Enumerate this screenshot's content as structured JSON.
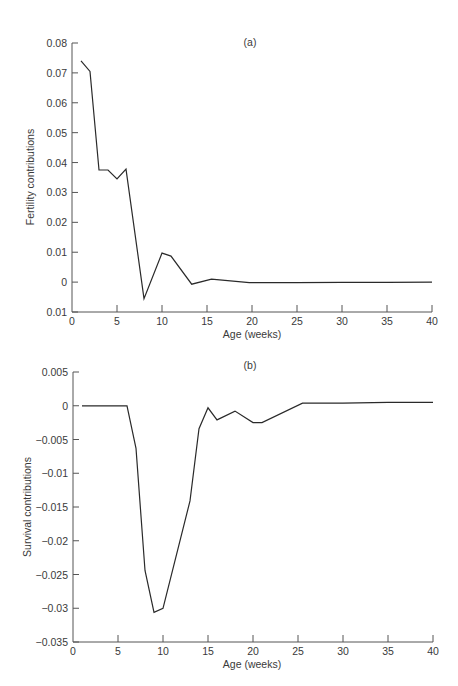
{
  "chart_data": [
    {
      "type": "line",
      "panel_label": "(a)",
      "title": "",
      "xlabel": "Age (weeks)",
      "ylabel": "Fertility contributions",
      "xlim": [
        0,
        40
      ],
      "ylim": [
        -0.01,
        0.08
      ],
      "xticks": [
        0,
        5,
        10,
        15,
        20,
        25,
        30,
        35,
        40
      ],
      "xtick_labels": [
        "0",
        "5",
        "10",
        "15",
        "20",
        "25",
        "30",
        "35",
        "40"
      ],
      "yticks": [
        0.08,
        0.07,
        0.06,
        0.05,
        0.04,
        0.03,
        0.02,
        0.01,
        0,
        -0.01
      ],
      "ytick_labels": [
        "0.08",
        "0.07",
        "0.06",
        "0.05",
        "0.04",
        "0.03",
        "0.02",
        "0.01",
        "0",
        "0.01"
      ],
      "grid": false,
      "legend": null,
      "series": [
        {
          "name": "Fertility contributions",
          "x": [
            1,
            2,
            3,
            4,
            5,
            6,
            8,
            10,
            11,
            13.3,
            15.5,
            19.7,
            25,
            30,
            35,
            40
          ],
          "y": [
            0.074,
            0.0705,
            0.0375,
            0.0375,
            0.0345,
            0.0378,
            -0.0055,
            0.0097,
            0.0087,
            -0.0007,
            0.001,
            -0.0002,
            -0.0002,
            -0.0001,
            -0.0001,
            0.0
          ]
        }
      ]
    },
    {
      "type": "line",
      "panel_label": "(b)",
      "title": "",
      "xlabel": "Age (weeks)",
      "ylabel": "Survival contributions",
      "xlim": [
        0,
        40
      ],
      "ylim": [
        -0.035,
        0.005
      ],
      "xticks": [
        0,
        5,
        10,
        15,
        20,
        25,
        30,
        35,
        40
      ],
      "xtick_labels": [
        "0",
        "5",
        "10",
        "15",
        "20",
        "25",
        "30",
        "35",
        "40"
      ],
      "yticks": [
        0.005,
        0,
        -0.005,
        -0.01,
        -0.015,
        -0.02,
        -0.025,
        -0.03,
        -0.035
      ],
      "ytick_labels": [
        "0.005",
        "0",
        "−0.005",
        "−0.01",
        "−0.015",
        "−0.02",
        "−0.025",
        "−0.03",
        "−0.035"
      ],
      "grid": false,
      "legend": null,
      "series": [
        {
          "name": "Survival contributions",
          "x": [
            1,
            2,
            3,
            4,
            5,
            6,
            7,
            8,
            9,
            10,
            13,
            14,
            15,
            16,
            18,
            20,
            21,
            25.5,
            30,
            35,
            40
          ],
          "y": [
            0,
            0,
            0,
            0,
            0,
            0,
            -0.0063,
            -0.0244,
            -0.0306,
            -0.03,
            -0.0141,
            -0.0034,
            -0.0003,
            -0.0021,
            -0.0008,
            -0.0025,
            -0.0025,
            0.0004,
            0.0004,
            0.0005,
            0.0005
          ]
        }
      ]
    }
  ]
}
